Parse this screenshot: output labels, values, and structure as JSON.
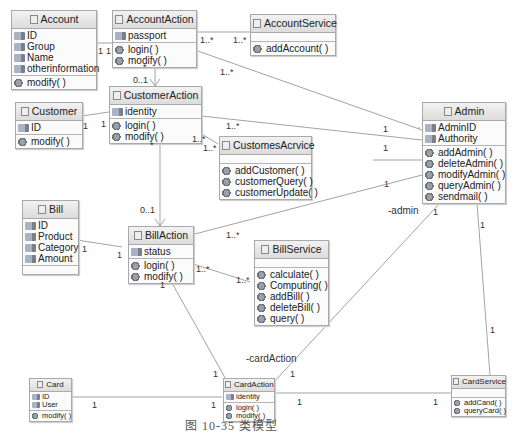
{
  "classes": {
    "account": {
      "name": "Account",
      "attributes": [
        "ID",
        "Group",
        "Name",
        "otherinformation"
      ],
      "operations": [
        "modify( )"
      ]
    },
    "accountAction": {
      "name": "AccountAction",
      "attributes": [
        "passport"
      ],
      "operations": [
        "login( )",
        "modify( )"
      ]
    },
    "accountService": {
      "name": "AccountService",
      "attributes": [],
      "operations": [
        "addAccount( )"
      ]
    },
    "customer": {
      "name": "Customer",
      "attributes": [
        "ID"
      ],
      "operations": [
        "modify( )"
      ]
    },
    "customerAction": {
      "name": "CustomerAction",
      "attributes": [
        "identity"
      ],
      "operations": [
        "login( )",
        "modify( )"
      ]
    },
    "customesAcrvice": {
      "name": "CustomesAcrvice",
      "attributes": [],
      "operations": [
        "addCustomer( )",
        "customerQuery( )",
        "customerUpdate( )"
      ]
    },
    "admin": {
      "name": "Admin",
      "attributes": [
        "AdminID",
        "Authority"
      ],
      "operations": [
        "addAdmin( )",
        "deleteAdmin( )",
        "modifyAdmin( )",
        "queryAdmin( )",
        "sendmail( )"
      ]
    },
    "bill": {
      "name": "Bill",
      "attributes": [
        "ID",
        "Product",
        "Category",
        "Amount"
      ],
      "operations": []
    },
    "billAction": {
      "name": "BillAction",
      "attributes": [
        "status"
      ],
      "operations": [
        "login( )",
        "modify( )"
      ]
    },
    "billService": {
      "name": "BillService",
      "attributes": [],
      "operations": [
        "calculate( )",
        "Computing( )",
        "addBill( )",
        "deleteBill( )",
        "query( )"
      ]
    },
    "card": {
      "name": "Card",
      "attributes": [
        "ID",
        "User"
      ],
      "operations": [
        "modify( )"
      ]
    },
    "cardAction": {
      "name": "CardAction",
      "attributes": [
        "identity"
      ],
      "operations": [
        "login( )",
        "modify( )"
      ]
    },
    "cardService": {
      "name": "CardService",
      "attributes": [],
      "operations": [
        "addCand( )",
        "queryCard( )"
      ]
    }
  },
  "multiplicities": {
    "acc_aa_1a": "1",
    "acc_aa_1b": "1",
    "aa_as_1": "1..*",
    "aa_as_2": "1..*",
    "aa_admin": "1..*",
    "aa_ca_star": "*",
    "aa_ca_01": "0..1",
    "cust_ca_1a": "1",
    "cust_ca_1b": "1",
    "ca_admin_1n": "1..*",
    "ca_admin_1": "1",
    "ca_cs_1": "1..*",
    "ca_cs_2": "1..*",
    "cs_admin_1": "1",
    "ca_ba_star": "*",
    "ca_ba_01": "0..1",
    "ba_admin_1n": "1..*",
    "ba_admin_1": "1",
    "bill_ba_1a": "1",
    "bill_ba_1b": "1",
    "ba_bs_1": "1..*",
    "ba_bs_2": "1..*",
    "ba_cardact_1a": "1",
    "ba_cardact_1b": "1",
    "admin_cardact_1a": "1",
    "admin_cardact_1b": "1",
    "admin_cardsvc_1a": "1",
    "admin_cardsvc_1b": "1",
    "card_cardact_1a": "1",
    "card_cardact_1b": "1",
    "cardact_cardsvc_1a": "1",
    "cardact_cardsvc_1b": "1"
  },
  "roles": {
    "admin": "-admin",
    "cardAction": "-cardAction"
  },
  "caption": "图 10-35   类模型"
}
